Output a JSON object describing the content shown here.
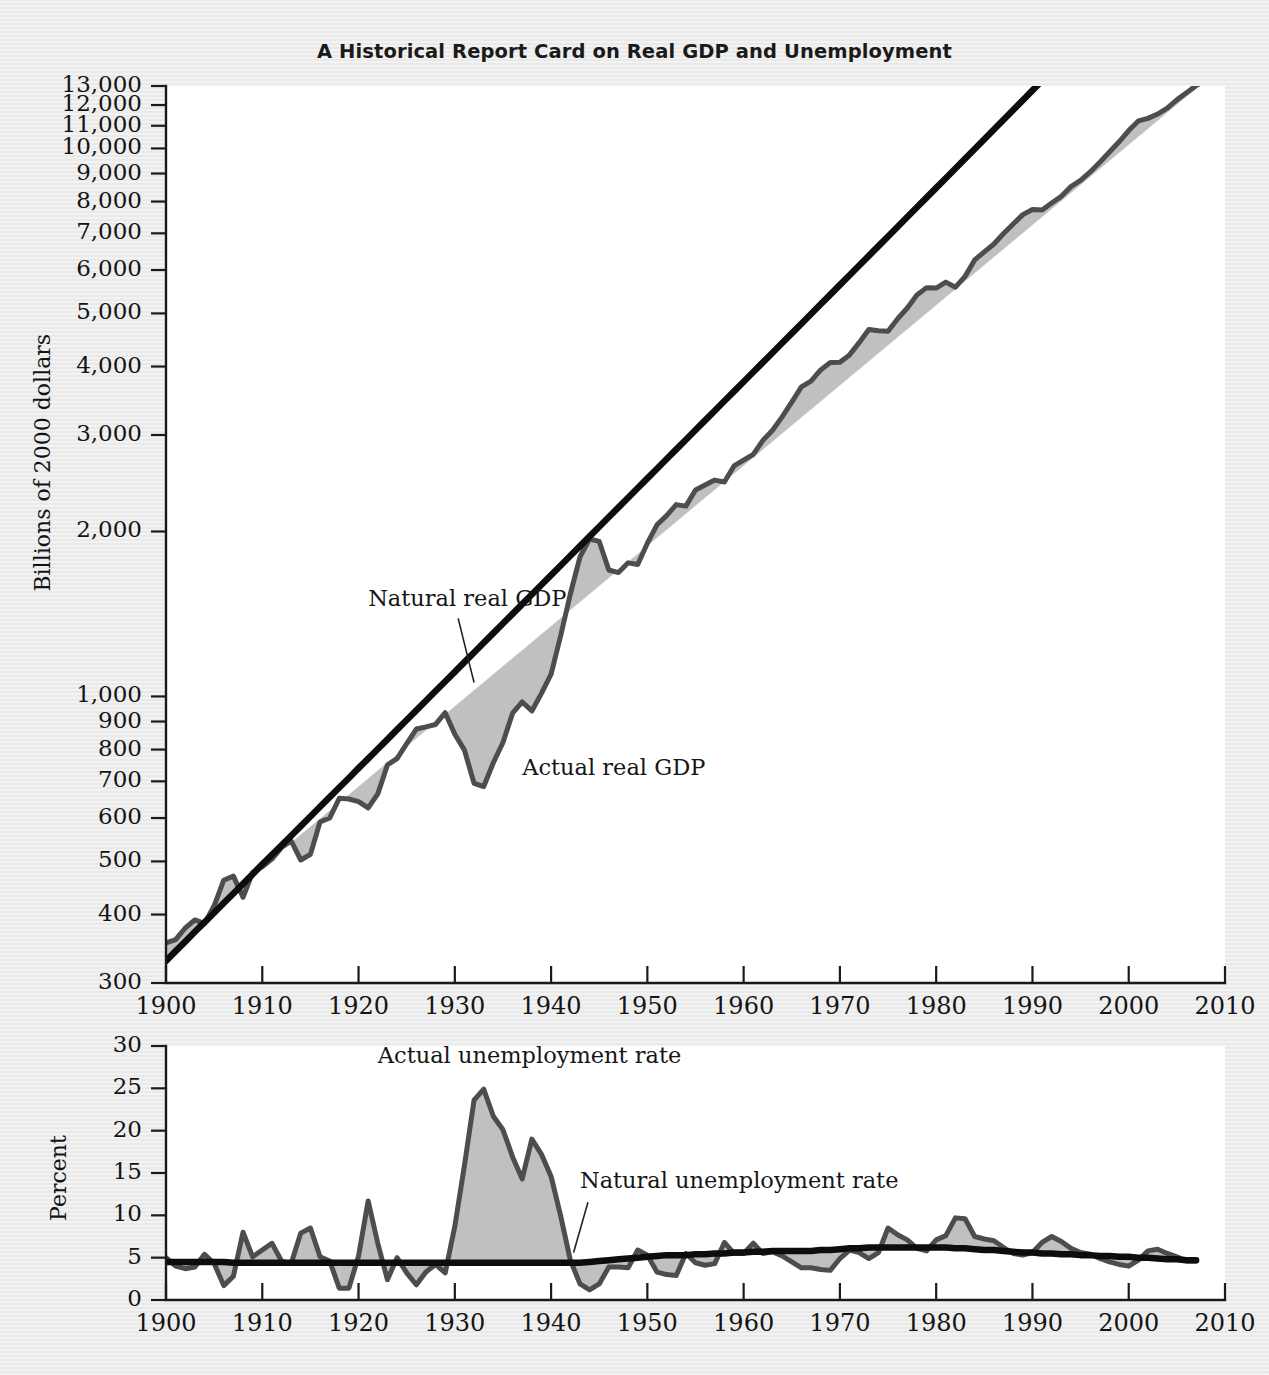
{
  "title": "A Historical Report Card on Real GDP and Unemployment",
  "colors": {
    "page_background": "#ececec",
    "panel_background": "#ffffff",
    "natural_line": "#0d0d0d",
    "actual_line": "#4d4d4d",
    "gap_fill": "#bdbdbd",
    "text": "#141414"
  },
  "chart_data": [
    {
      "type": "line",
      "id": "real-gdp",
      "title": "A Historical Report Card on Real GDP and Unemployment",
      "xlabel": "",
      "ylabel": "Billions of 2000 dollars",
      "yscale": "log",
      "ylim": [
        300,
        13000
      ],
      "xlim": [
        1900,
        2010
      ],
      "grid": false,
      "legend": "annotations",
      "ytick_labels": [
        "13,000",
        "12,000",
        "11,000",
        "10,000",
        "9,000",
        "8,000",
        "7,000",
        "6,000",
        "5,000",
        "4,000",
        "3,000",
        "2,000",
        "1,000",
        "900",
        "800",
        "700",
        "600",
        "500",
        "400",
        "300"
      ],
      "ytick_values": [
        13000,
        12000,
        11000,
        10000,
        9000,
        8000,
        7000,
        6000,
        5000,
        4000,
        3000,
        2000,
        1000,
        900,
        800,
        700,
        600,
        500,
        400,
        300
      ],
      "xtick_labels": [
        "1900",
        "1910",
        "1920",
        "1930",
        "1940",
        "1950",
        "1960",
        "1970",
        "1980",
        "1990",
        "2000",
        "2010"
      ],
      "xtick_values": [
        1900,
        1910,
        1920,
        1930,
        1940,
        1950,
        1960,
        1970,
        1980,
        1990,
        2000,
        2010
      ],
      "annotations": [
        {
          "text": "Natural real GDP",
          "x": 1921,
          "y": 1460,
          "leader_to_x": 1932,
          "leader_to_y": 1060
        },
        {
          "text": "Actual real GDP",
          "x": 1937,
          "y": 720,
          "leader_to_x": null,
          "leader_to_y": null
        }
      ],
      "x": [
        1900,
        1901,
        1902,
        1903,
        1904,
        1905,
        1906,
        1907,
        1908,
        1909,
        1910,
        1911,
        1912,
        1913,
        1914,
        1915,
        1916,
        1917,
        1918,
        1919,
        1920,
        1921,
        1922,
        1923,
        1924,
        1925,
        1926,
        1927,
        1928,
        1929,
        1930,
        1931,
        1932,
        1933,
        1934,
        1935,
        1936,
        1937,
        1938,
        1939,
        1940,
        1941,
        1942,
        1943,
        1944,
        1945,
        1946,
        1947,
        1948,
        1949,
        1950,
        1951,
        1952,
        1953,
        1954,
        1955,
        1956,
        1957,
        1958,
        1959,
        1960,
        1961,
        1962,
        1963,
        1964,
        1965,
        1966,
        1967,
        1968,
        1969,
        1970,
        1971,
        1972,
        1973,
        1974,
        1975,
        1976,
        1977,
        1978,
        1979,
        1980,
        1981,
        1982,
        1983,
        1984,
        1985,
        1986,
        1987,
        1988,
        1989,
        1990,
        1991,
        1992,
        1993,
        1994,
        1995,
        1996,
        1997,
        1998,
        1999,
        2000,
        2001,
        2002,
        2003,
        2004,
        2005,
        2006,
        2007,
        2008
      ],
      "series": [
        {
          "name": "Actual real GDP",
          "values": [
            355,
            360,
            378,
            391,
            385,
            415,
            462,
            470,
            430,
            477,
            489,
            505,
            530,
            545,
            503,
            515,
            590,
            600,
            652,
            650,
            643,
            626,
            664,
            750,
            770,
            820,
            872,
            880,
            889,
            934,
            853,
            798,
            694,
            685,
            757,
            824,
            932,
            977,
            941,
            1013,
            1098,
            1292,
            1538,
            1798,
            1938,
            1918,
            1701,
            1683,
            1753,
            1741,
            1904,
            2057,
            2138,
            2239,
            2225,
            2381,
            2431,
            2482,
            2462,
            2634,
            2700,
            2766,
            2933,
            3061,
            3237,
            3445,
            3671,
            3762,
            3943,
            4067,
            4071,
            4200,
            4422,
            4672,
            4647,
            4639,
            4889,
            5114,
            5400,
            5572,
            5563,
            5702,
            5583,
            5842,
            6260,
            6476,
            6694,
            6994,
            7282,
            7572,
            7736,
            7718,
            7951,
            8177,
            8518,
            8741,
            9061,
            9434,
            9854,
            10284,
            10780,
            11226,
            11347,
            11553,
            11841,
            12264,
            12638,
            13020,
            13299,
            13332
          ]
        },
        {
          "name": "Natural real GDP",
          "values": [
            329,
            343,
            357,
            372,
            387,
            403,
            420,
            437,
            455,
            474,
            494,
            514,
            535,
            557,
            580,
            604,
            629,
            655,
            682,
            710,
            740,
            770,
            802,
            835,
            870,
            906,
            943,
            982,
            1023,
            1065,
            1109,
            1155,
            1203,
            1253,
            1305,
            1359,
            1415,
            1474,
            1535,
            1599,
            1665,
            1734,
            1806,
            1881,
            1959,
            2040,
            2125,
            2213,
            2305,
            2401,
            2500,
            2604,
            2712,
            2824,
            2941,
            3063,
            3190,
            3322,
            3460,
            3603,
            3753,
            3908,
            4070,
            4239,
            4415,
            4598,
            4789,
            4988,
            5195,
            5411,
            5636,
            5870,
            6114,
            6368,
            6633,
            6909,
            7196,
            7496,
            7808,
            8133,
            8472,
            8825,
            9193,
            9577,
            9977,
            10394,
            10829,
            11283,
            11756,
            12249,
            12763,
            13298,
            13856,
            14437,
            15042,
            15672,
            16329,
            17013,
            17725,
            18467,
            19240,
            20045,
            20884,
            21758,
            22669,
            23618,
            24607,
            25638
          ]
        }
      ]
    },
    {
      "type": "line",
      "id": "unemployment",
      "title": "",
      "xlabel": "",
      "ylabel": "Percent",
      "yscale": "linear",
      "ylim": [
        0,
        30
      ],
      "xlim": [
        1900,
        2010
      ],
      "grid": false,
      "legend": "annotations",
      "ytick_labels": [
        "0",
        "5",
        "10",
        "15",
        "20",
        "25",
        "30"
      ],
      "ytick_values": [
        0,
        5,
        10,
        15,
        20,
        25,
        30
      ],
      "xtick_labels": [
        "1900",
        "1910",
        "1920",
        "1930",
        "1940",
        "1950",
        "1960",
        "1970",
        "1980",
        "1990",
        "2000",
        "2010"
      ],
      "xtick_values": [
        1900,
        1910,
        1920,
        1930,
        1940,
        1950,
        1960,
        1970,
        1980,
        1990,
        2000,
        2010
      ],
      "annotations": [
        {
          "text": "Actual unemployment rate",
          "x": 1922,
          "y": 28.0,
          "leader_to_x": null,
          "leader_to_y": null
        },
        {
          "text": "Natural unemployment rate",
          "x": 1943,
          "y": 13.2,
          "leader_to_x": 1944,
          "leader_to_y": 5.6
        }
      ],
      "x": [
        1900,
        1901,
        1902,
        1903,
        1904,
        1905,
        1906,
        1907,
        1908,
        1909,
        1910,
        1911,
        1912,
        1913,
        1914,
        1915,
        1916,
        1917,
        1918,
        1919,
        1920,
        1921,
        1922,
        1923,
        1924,
        1925,
        1926,
        1927,
        1928,
        1929,
        1930,
        1931,
        1932,
        1933,
        1934,
        1935,
        1936,
        1937,
        1938,
        1939,
        1940,
        1941,
        1942,
        1943,
        1944,
        1945,
        1946,
        1947,
        1948,
        1949,
        1950,
        1951,
        1952,
        1953,
        1954,
        1955,
        1956,
        1957,
        1958,
        1959,
        1960,
        1961,
        1962,
        1963,
        1964,
        1965,
        1966,
        1967,
        1968,
        1969,
        1970,
        1971,
        1972,
        1973,
        1974,
        1975,
        1976,
        1977,
        1978,
        1979,
        1980,
        1981,
        1982,
        1983,
        1984,
        1985,
        1986,
        1987,
        1988,
        1989,
        1990,
        1991,
        1992,
        1993,
        1994,
        1995,
        1996,
        1997,
        1998,
        1999,
        2000,
        2001,
        2002,
        2003,
        2004,
        2005,
        2006,
        2007
      ],
      "series": [
        {
          "name": "Actual unemployment rate",
          "values": [
            5.0,
            4.0,
            3.7,
            3.9,
            5.4,
            4.3,
            1.7,
            2.8,
            8.0,
            5.1,
            5.9,
            6.7,
            4.6,
            4.3,
            7.9,
            8.5,
            5.1,
            4.6,
            1.4,
            1.4,
            5.2,
            11.7,
            6.7,
            2.4,
            5.0,
            3.2,
            1.8,
            3.3,
            4.2,
            3.2,
            8.7,
            15.9,
            23.6,
            24.9,
            21.7,
            20.1,
            16.9,
            14.3,
            19.0,
            17.2,
            14.6,
            9.9,
            4.7,
            1.9,
            1.2,
            1.9,
            3.9,
            3.9,
            3.8,
            5.9,
            5.3,
            3.3,
            3.0,
            2.9,
            5.5,
            4.4,
            4.1,
            4.3,
            6.8,
            5.5,
            5.5,
            6.7,
            5.5,
            5.7,
            5.2,
            4.5,
            3.8,
            3.8,
            3.6,
            3.5,
            4.9,
            5.9,
            5.6,
            4.9,
            5.6,
            8.5,
            7.7,
            7.1,
            6.1,
            5.8,
            7.1,
            7.6,
            9.7,
            9.6,
            7.5,
            7.2,
            7.0,
            6.2,
            5.5,
            5.3,
            5.6,
            6.8,
            7.5,
            6.9,
            6.1,
            5.6,
            5.4,
            4.9,
            4.5,
            4.2,
            4.0,
            4.7,
            5.8,
            6.0,
            5.5,
            5.1,
            4.6,
            4.6
          ]
        },
        {
          "name": "Natural unemployment rate",
          "values": [
            4.5,
            4.5,
            4.5,
            4.5,
            4.5,
            4.5,
            4.5,
            4.4,
            4.4,
            4.4,
            4.4,
            4.4,
            4.4,
            4.4,
            4.4,
            4.4,
            4.4,
            4.4,
            4.4,
            4.4,
            4.4,
            4.4,
            4.4,
            4.4,
            4.4,
            4.4,
            4.4,
            4.4,
            4.4,
            4.4,
            4.4,
            4.4,
            4.4,
            4.4,
            4.4,
            4.4,
            4.4,
            4.4,
            4.4,
            4.4,
            4.4,
            4.4,
            4.4,
            4.4,
            4.5,
            4.6,
            4.7,
            4.8,
            4.9,
            5.0,
            5.1,
            5.2,
            5.3,
            5.3,
            5.3,
            5.4,
            5.4,
            5.5,
            5.5,
            5.6,
            5.6,
            5.7,
            5.7,
            5.8,
            5.8,
            5.8,
            5.8,
            5.8,
            5.9,
            5.9,
            6.0,
            6.1,
            6.1,
            6.2,
            6.2,
            6.2,
            6.2,
            6.2,
            6.2,
            6.2,
            6.2,
            6.2,
            6.1,
            6.1,
            6.0,
            5.9,
            5.9,
            5.8,
            5.7,
            5.6,
            5.6,
            5.5,
            5.5,
            5.4,
            5.4,
            5.3,
            5.3,
            5.2,
            5.2,
            5.1,
            5.1,
            5.0,
            5.0,
            4.9,
            4.8,
            4.8,
            4.7,
            4.7
          ]
        }
      ]
    }
  ]
}
